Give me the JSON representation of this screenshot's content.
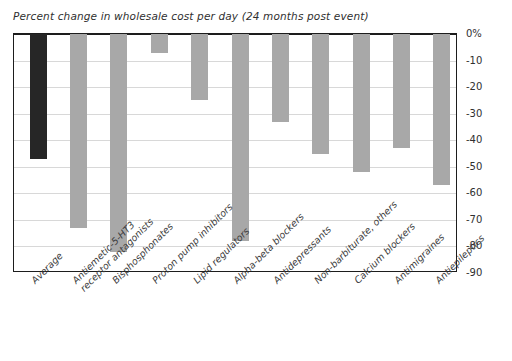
{
  "chart_data": {
    "type": "bar",
    "title": "Percent change in wholesale cost per day (24 months post event)",
    "xlabel": "",
    "ylabel": "",
    "ylim": [
      -90,
      0
    ],
    "grid": true,
    "legend": false,
    "yticks": [
      "0%",
      "-10",
      "-20",
      "-30",
      "-40",
      "-50",
      "-60",
      "-70",
      "-80",
      "-90"
    ],
    "ytick_values": [
      0,
      -10,
      -20,
      -30,
      -40,
      -50,
      -60,
      -70,
      -80,
      -90
    ],
    "categories": [
      "Average",
      "Antiemetic-5-HT3\nreceptor antagonists",
      "Bisphosphonates",
      "Proton pump inhibitors",
      "Lipid regulators",
      "Alpha-beta blockers",
      "Antidepressants",
      "Non-barbiturate, others",
      "Calcium blockers",
      "Antimigraines",
      "Antiepileptics"
    ],
    "values": [
      -47,
      -73,
      -82,
      -7,
      -25,
      -78,
      -33,
      -45,
      -52,
      -43,
      -57
    ],
    "colors": {
      "average_bar": "#262626",
      "category_bar": "#a8a8a8",
      "axis": "#1d1d1d",
      "gridline": "#d8d8d8",
      "background": "#ffffff"
    }
  }
}
